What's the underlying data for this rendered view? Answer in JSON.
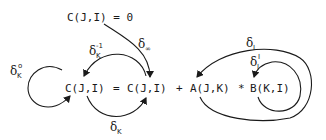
{
  "diagram": {
    "statements": {
      "init": "C(J,I) = 0",
      "main": {
        "lhs": "C(J,I)",
        "eq": "=",
        "rhs_c": "C(J,I)",
        "plus": "+",
        "a": "A(J,K)",
        "times": "*",
        "b": "B(K,I)"
      }
    },
    "edges": [
      {
        "id": "delta-inf",
        "symbol": "δ",
        "sub": "∞",
        "sup": "",
        "from": "C(J,I) = 0",
        "to": "C(J,I) (rhs)"
      },
      {
        "id": "delta-k-inv",
        "symbol": "δ",
        "sub": "K",
        "sup": "-1",
        "from": "C(J,I) (rhs)",
        "to": "C(J,I) (lhs)"
      },
      {
        "id": "delta-k-0",
        "symbol": "δ",
        "sub": "K",
        "sup": "o",
        "from": "C(J,I) (lhs)",
        "to": "C(J,I) (lhs)"
      },
      {
        "id": "delta-k",
        "symbol": "δ",
        "sub": "K",
        "sup": "",
        "from": "C(J,I) (lhs)",
        "to": "C(J,I) (rhs)"
      },
      {
        "id": "delta-i",
        "symbol": "δ",
        "sub": "I",
        "sup": "",
        "from": "B(K,I)",
        "to": "A(J,K)"
      },
      {
        "id": "delta-i-i",
        "symbol": "δ",
        "sub": "I",
        "sup": "I",
        "from": "B(K,I)",
        "to": "B(K,I)"
      }
    ]
  }
}
